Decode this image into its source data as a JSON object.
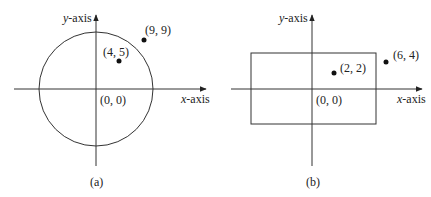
{
  "panels": [
    {
      "id": "a",
      "caption": "(a)",
      "shape": "circle",
      "axes": {
        "x_label_var": "x",
        "x_label_rest": "-axis",
        "y_label_var": "y",
        "y_label_rest": "-axis"
      },
      "origin_label": "(0, 0)",
      "points": [
        {
          "label": "(4, 5)",
          "x": 4,
          "y": 5,
          "inside": true
        },
        {
          "label": "(9, 9)",
          "x": 9,
          "y": 9,
          "inside": false
        }
      ]
    },
    {
      "id": "b",
      "caption": "(b)",
      "shape": "rectangle",
      "axes": {
        "x_label_var": "x",
        "x_label_rest": "-axis",
        "y_label_var": "y",
        "y_label_rest": "-axis"
      },
      "origin_label": "(0, 0)",
      "points": [
        {
          "label": "(2, 2)",
          "x": 2,
          "y": 2,
          "inside": true
        },
        {
          "label": "(6, 4)",
          "x": 6,
          "y": 4,
          "inside": false
        }
      ]
    }
  ],
  "colors": {
    "stroke": "#333333",
    "point": "#111111",
    "text": "#222222",
    "background": "#ffffff"
  }
}
